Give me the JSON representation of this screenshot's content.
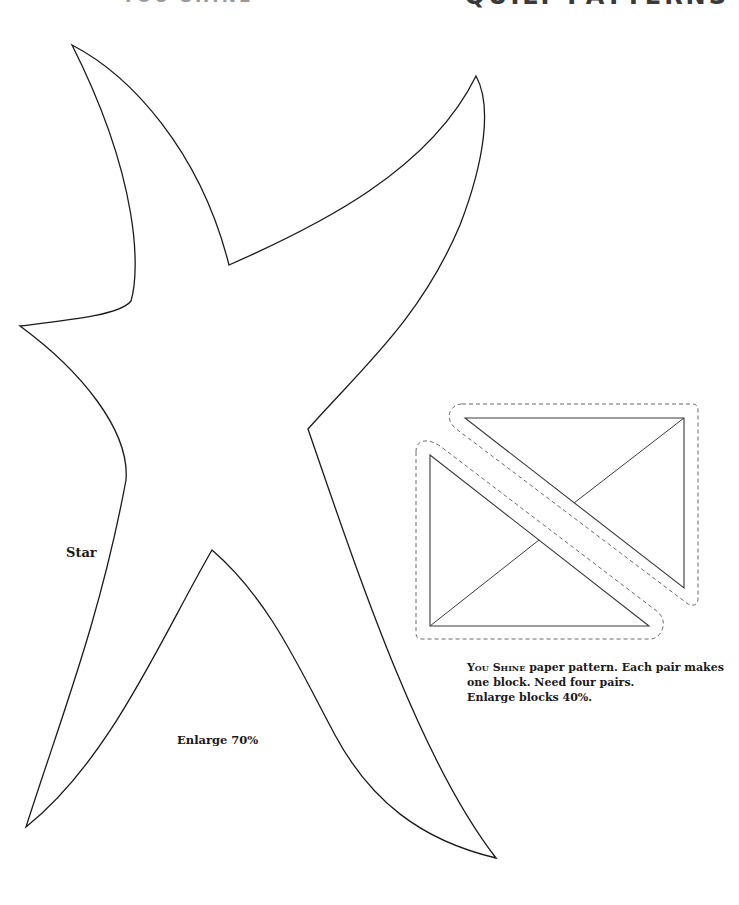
{
  "header": {
    "left_title": "YOU SHINE",
    "right_title": "QUILT PATTERNS"
  },
  "star_pattern": {
    "label": "Star",
    "enlarge_note": "Enlarge 70%",
    "stroke_color": "#1a1a1a"
  },
  "block_pattern": {
    "caption": {
      "name": "You Shine",
      "line1_rest": " paper pattern. Each pair makes",
      "line2": "one block. Need four pairs.",
      "line3": "Enlarge blocks 40%."
    },
    "solid_line_color": "#3a3a3a",
    "dashed_line_color": "#6a6a6a"
  }
}
